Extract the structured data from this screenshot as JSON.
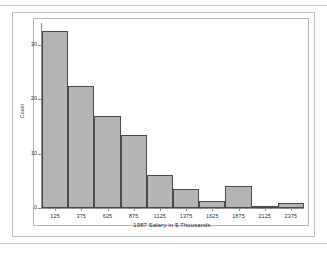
{
  "figure": {
    "y_axis_title": "Count",
    "x_axis_title": "1987 Salary in $ Thousands",
    "bar_fill_color": "#b4b4b4",
    "bar_edge_color": "#4a4a4a",
    "axis_color": "#8c8c8c",
    "panel_border_color": "#bdbdbd",
    "background_color": "#ffffff"
  },
  "chart_data": {
    "type": "bar",
    "title": "",
    "subtitle": "",
    "xlabel": "1987 Salary in $ Thousands",
    "ylabel": "Count",
    "categories": [
      "125",
      "375",
      "625",
      "875",
      "1125",
      "1375",
      "1625",
      "1875",
      "2125",
      "2375"
    ],
    "values": [
      32.5,
      22.5,
      17,
      13.5,
      6,
      3.5,
      1.2,
      4,
      0.2,
      1
    ],
    "xtick_labels": [
      "125",
      "375",
      "625",
      "875",
      "1125",
      "1375",
      "1625",
      "1875",
      "2125",
      "2375"
    ],
    "ytick_labels": [
      "0",
      "10",
      "20",
      "30"
    ],
    "ytick_values": [
      0,
      10,
      20,
      30
    ],
    "ylim": [
      0,
      34
    ],
    "xlim": [
      0,
      2500
    ],
    "bin_width": 250,
    "grid": false,
    "legend": false,
    "legend_position": "none"
  }
}
